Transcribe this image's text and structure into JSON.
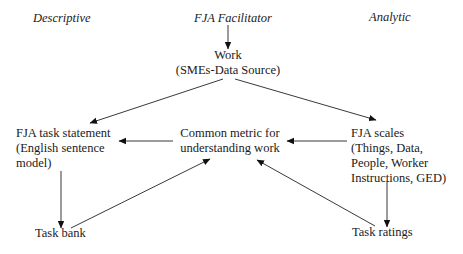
{
  "headers": {
    "left": "Descriptive",
    "center": "FJA Facilitator",
    "right": "Analytic"
  },
  "nodes": {
    "work": {
      "line1": "Work",
      "line2": "(SMEs-Data Source)"
    },
    "task_statement": {
      "line1": "FJA task statement",
      "line2": "(English sentence",
      "line3": "model)"
    },
    "common_metric": {
      "line1": "Common metric for",
      "line2": "understanding work"
    },
    "fja_scales": {
      "line1": "FJA scales",
      "line2": "(Things, Data,",
      "line3": "People, Worker",
      "line4": "Instructions, GED)"
    },
    "task_bank": {
      "line1": "Task bank"
    },
    "task_ratings": {
      "line1": "Task ratings"
    }
  },
  "edges": [
    {
      "from": "FJA Facilitator",
      "to": "Work"
    },
    {
      "from": "Work",
      "to": "FJA task statement"
    },
    {
      "from": "Work",
      "to": "FJA scales"
    },
    {
      "from": "Common metric for understanding work",
      "to": "FJA task statement"
    },
    {
      "from": "FJA scales",
      "to": "Common metric for understanding work"
    },
    {
      "from": "FJA task statement",
      "to": "Task bank"
    },
    {
      "from": "FJA scales",
      "to": "Task ratings"
    },
    {
      "from": "Task bank",
      "to": "Common metric for understanding work"
    },
    {
      "from": "Task ratings",
      "to": "Common metric for understanding work"
    }
  ]
}
